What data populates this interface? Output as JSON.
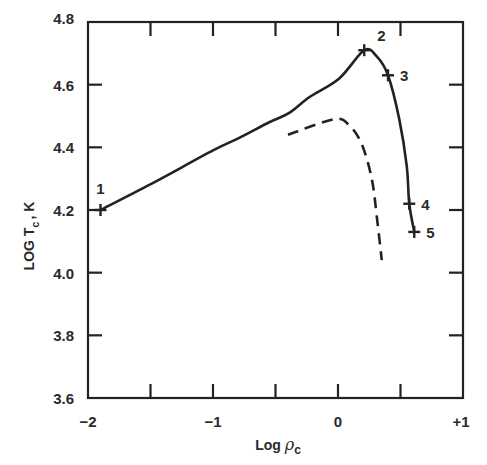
{
  "chart_data": {
    "type": "line",
    "title": "",
    "xlabel": "Log ρc",
    "xlabel_main": "Log ",
    "xlabel_symbol": "ρ",
    "xlabel_sub": "c",
    "ylabel": "LOG Tc , K",
    "ylabel_main": "LOG T",
    "ylabel_sub": "c",
    "ylabel_suffix": ", K",
    "xlim": [
      -2,
      1
    ],
    "ylim": [
      3.6,
      4.8
    ],
    "x_ticks": [
      -2,
      -1.5,
      -1,
      -0.5,
      0,
      0.5,
      1
    ],
    "x_tick_labels": [
      {
        "value": -2,
        "label": "−2"
      },
      {
        "value": -1,
        "label": "−1"
      },
      {
        "value": 0,
        "label": "0"
      },
      {
        "value": 1,
        "label": "+1"
      }
    ],
    "y_ticks": [
      3.6,
      3.8,
      4.0,
      4.2,
      4.4,
      4.6,
      4.8
    ],
    "y_tick_labels": [
      {
        "value": 3.6,
        "label": "3.6"
      },
      {
        "value": 3.8,
        "label": "3.8"
      },
      {
        "value": 4.0,
        "label": "4.0"
      },
      {
        "value": 4.2,
        "label": "4.2"
      },
      {
        "value": 4.4,
        "label": "4.4"
      },
      {
        "value": 4.6,
        "label": "4.6"
      },
      {
        "value": 4.8,
        "label": "4.8"
      }
    ],
    "grid": false,
    "legend": null,
    "series": [
      {
        "name": "solid-track",
        "style": "solid",
        "points": [
          [
            -1.9,
            4.2
          ],
          [
            -1.51,
            4.28
          ],
          [
            -1.0,
            4.39
          ],
          [
            -0.79,
            4.43
          ],
          [
            -0.55,
            4.48
          ],
          [
            -0.39,
            4.51
          ],
          [
            -0.23,
            4.56
          ],
          [
            0.01,
            4.62
          ],
          [
            0.21,
            4.71
          ],
          [
            0.31,
            4.69
          ],
          [
            0.4,
            4.63
          ],
          [
            0.49,
            4.49
          ],
          [
            0.55,
            4.34
          ],
          [
            0.57,
            4.22
          ],
          [
            0.61,
            4.13
          ]
        ]
      },
      {
        "name": "dashed-track",
        "style": "dashed",
        "points": [
          [
            -0.4,
            4.44
          ],
          [
            -0.03,
            4.49
          ],
          [
            0.09,
            4.47
          ],
          [
            0.19,
            4.41
          ],
          [
            0.27,
            4.3
          ],
          [
            0.31,
            4.18
          ],
          [
            0.35,
            4.04
          ]
        ]
      }
    ],
    "annotations": [
      {
        "label": "1",
        "x": -1.9,
        "y": 4.2,
        "marker": "+",
        "label_pos": "above"
      },
      {
        "label": "2",
        "x": 0.21,
        "y": 4.71,
        "marker": "+",
        "label_pos": "upper-right"
      },
      {
        "label": "3",
        "x": 0.4,
        "y": 4.63,
        "marker": "+",
        "label_pos": "right"
      },
      {
        "label": "4",
        "x": 0.57,
        "y": 4.22,
        "marker": "+",
        "label_pos": "right"
      },
      {
        "label": "5",
        "x": 0.61,
        "y": 4.13,
        "marker": "+",
        "label_pos": "right"
      }
    ]
  },
  "colors": {
    "ink": "#222222",
    "background": "#ffffff"
  }
}
